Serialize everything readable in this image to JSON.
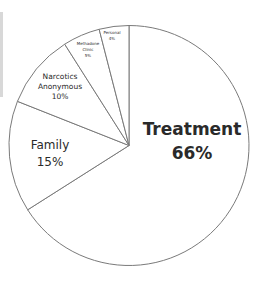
{
  "chart_data": {
    "type": "pie",
    "title": "",
    "start_angle_deg": 0,
    "direction": "clockwise",
    "slice_fill": "#ffffff",
    "slice_stroke": "#7a7a7a",
    "categories": [
      "Treatment",
      "Family",
      "Narcotics Anonymous",
      "Methadone Clinic",
      "Personal"
    ],
    "values": [
      66,
      15,
      10,
      5,
      4
    ],
    "labels": [
      {
        "lines": [
          "Treatment",
          "66%"
        ],
        "x": 192,
        "y": 135,
        "size": 17,
        "bold": true,
        "lh": 24
      },
      {
        "lines": [
          "Family",
          "15%"
        ],
        "x": 50,
        "y": 149,
        "size": 12,
        "bold": false,
        "lh": 17
      },
      {
        "lines": [
          "Narcotics",
          "Anonymous",
          "10%"
        ],
        "x": 60,
        "y": 79,
        "size": 7.5,
        "bold": false,
        "lh": 10
      },
      {
        "lines": [
          "Methadone",
          "Clinic",
          "5%"
        ],
        "x": 88,
        "y": 45,
        "size": 4,
        "bold": false,
        "lh": 6
      },
      {
        "lines": [
          "Personal",
          "4%"
        ],
        "x": 112,
        "y": 34,
        "size": 4,
        "bold": false,
        "lh": 6
      }
    ],
    "legend": null
  }
}
